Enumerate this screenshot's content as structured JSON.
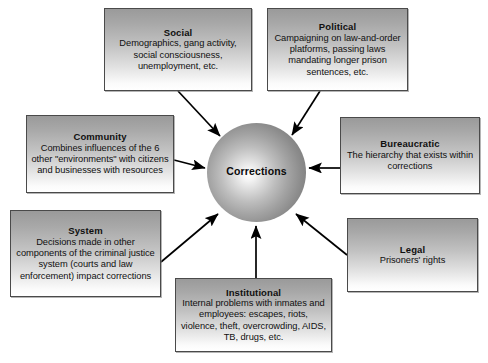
{
  "diagram": {
    "hub": {
      "label": "Corrections",
      "shape": "sphere"
    },
    "colors": {
      "box_border": "#4a4a4a",
      "box_gradient_top": "#9a9a9a",
      "box_gradient_bottom": "#ffffff",
      "text": "#101010",
      "arrow": "#000000",
      "background": "#ffffff"
    },
    "nodes": [
      {
        "id": "social",
        "title": "Social",
        "description": "Demographics, gang activity, social consciousness, unemployment, etc.",
        "arrow_to_hub": true
      },
      {
        "id": "political",
        "title": "Political",
        "description": "Campaigning on law-and-order platforms, passing laws mandating longer prison sentences, etc.",
        "arrow_to_hub": true
      },
      {
        "id": "community",
        "title": "Community",
        "description": "Combines influences of the 6 other \"environments\" with citizens and businesses with resources",
        "arrow_to_hub": true
      },
      {
        "id": "bureaucratic",
        "title": "Bureaucratic",
        "description": "The hierarchy that exists within corrections",
        "arrow_to_hub": true
      },
      {
        "id": "system",
        "title": "System",
        "description": "Decisions made in other components of the criminal justice system (courts and law enforcement) impact corrections",
        "arrow_to_hub": true
      },
      {
        "id": "legal",
        "title": "Legal",
        "description": "Prisoners' rights",
        "arrow_to_hub": true
      },
      {
        "id": "institutional",
        "title": "Institutional",
        "description": "Internal problems with inmates and employees: escapes, riots, violence, theft, overcrowding, AIDS, TB, drugs, etc.",
        "arrow_to_hub": true
      }
    ]
  }
}
